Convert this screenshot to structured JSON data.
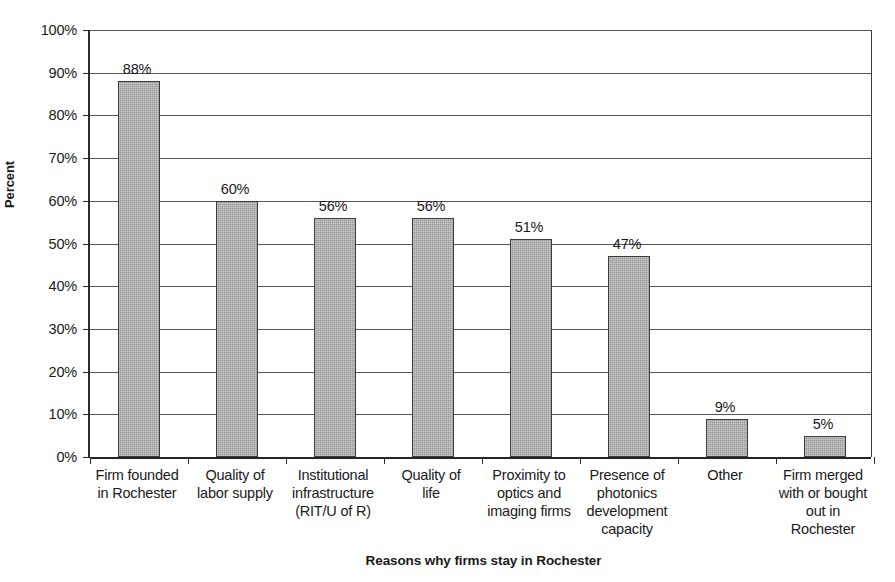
{
  "chart_data": {
    "type": "bar",
    "title": "",
    "xlabel": "Reasons why firms stay in Rochester",
    "ylabel": "Percent",
    "ylim": [
      0,
      100
    ],
    "grid": true,
    "legend": "none",
    "orientation": "vertical",
    "categories": [
      "Firm founded in Rochester",
      "Quality of labor supply",
      "Institutional infrastructure (RIT/U of R)",
      "Quality of life",
      "Proximity to optics and imaging firms",
      "Presence of photonics development capacity",
      "Other",
      "Firm merged with or bought out in Rochester"
    ],
    "category_lines": [
      [
        "Firm founded",
        "in Rochester"
      ],
      [
        "Quality of",
        "labor supply"
      ],
      [
        "Institutional",
        "infrastructure",
        "(RIT/U of R)"
      ],
      [
        "Quality of",
        "life"
      ],
      [
        "Proximity to",
        "optics and",
        "imaging firms"
      ],
      [
        "Presence of",
        "photonics",
        "development",
        "capacity"
      ],
      [
        "Other"
      ],
      [
        "Firm merged",
        "with or bought",
        "out in",
        "Rochester"
      ]
    ],
    "values": [
      88,
      60,
      56,
      56,
      51,
      47,
      9,
      5
    ],
    "data_labels": [
      "88%",
      "60%",
      "56%",
      "56%",
      "51%",
      "47%",
      "9%",
      "5%"
    ],
    "y_ticks": [
      0,
      10,
      20,
      30,
      40,
      50,
      60,
      70,
      80,
      90,
      100
    ],
    "y_tick_labels": [
      "0%",
      "10%",
      "20%",
      "30%",
      "40%",
      "50%",
      "60%",
      "70%",
      "80%",
      "90%",
      "100%"
    ],
    "bar_color": "#a9a9a9",
    "bar_edge_color": "#3c3c3c",
    "grid_color": "#55555a",
    "axis_color": "#242424"
  }
}
